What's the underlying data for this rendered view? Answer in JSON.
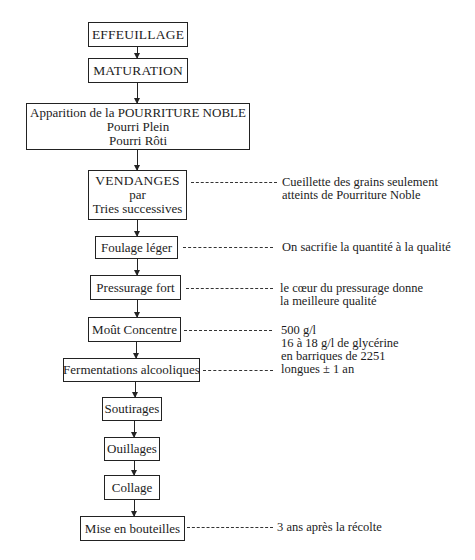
{
  "diagram": {
    "type": "flowchart",
    "title_cut": "",
    "steps": [
      {
        "id": "effeuillage",
        "lines": [
          "EFFEUILLAGE"
        ]
      },
      {
        "id": "maturation",
        "lines": [
          "MATURATION"
        ]
      },
      {
        "id": "pourriture",
        "lines": [
          "Apparition de la POURRITURE NOBLE",
          "Pourri Plein",
          "Pourri Rôti"
        ]
      },
      {
        "id": "vendanges",
        "lines": [
          "VENDANGES",
          "par",
          "Tries successives"
        ]
      },
      {
        "id": "foulage",
        "lines": [
          "Foulage léger"
        ]
      },
      {
        "id": "pressurage",
        "lines": [
          "Pressurage fort"
        ]
      },
      {
        "id": "mout",
        "lines": [
          "Moût Concentre"
        ]
      },
      {
        "id": "fermentations",
        "lines": [
          "Fermentations alcooliques"
        ]
      },
      {
        "id": "soutirages",
        "lines": [
          "Soutirages"
        ]
      },
      {
        "id": "ouillages",
        "lines": [
          "Ouillages"
        ]
      },
      {
        "id": "collage",
        "lines": [
          "Collage"
        ]
      },
      {
        "id": "mise",
        "lines": [
          "Mise en bouteilles"
        ]
      }
    ],
    "notes": {
      "vendanges": [
        "Cueillette des grains seulement",
        "atteints de Pourriture Noble"
      ],
      "foulage": [
        "On sacrifie la quantité à la qualité"
      ],
      "pressurage": [
        "le cœur du pressurage donne",
        "la meilleure qualité"
      ],
      "mout_fermentations": [
        "500 g/l",
        "16 à 18 g/l de glycérine",
        "en barriques de 2251",
        "longues ± 1 an"
      ],
      "mise": [
        "3 ans après la récolte"
      ]
    }
  }
}
